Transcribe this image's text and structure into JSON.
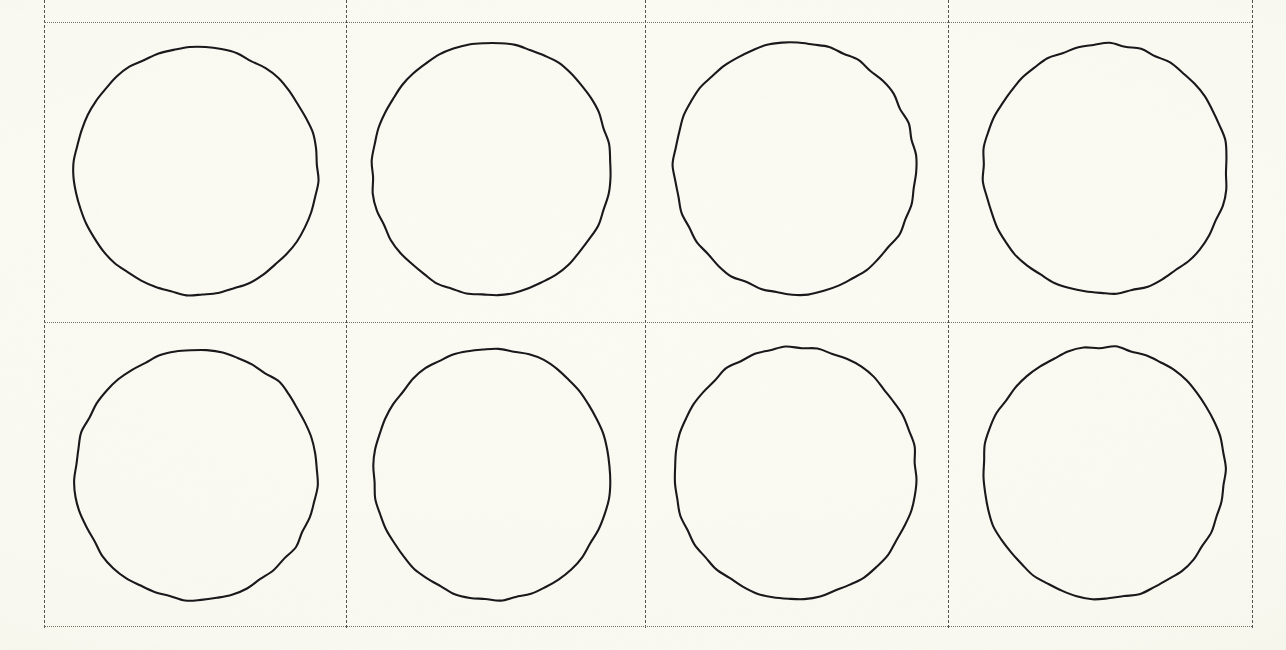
{
  "document": {
    "kind": "scanned-worksheet",
    "title": "Circle Grid Worksheet",
    "page_width": 1286,
    "page_height": 650,
    "background_color": "#fdfdfa",
    "has_text": false,
    "note": ""
  },
  "grid": {
    "columns": 4,
    "rows": 2,
    "line_style_vertical": "dashed",
    "line_style_horizontal": "dotted",
    "vertical_line_color": "#3b3b3b",
    "horizontal_line_color": "#6d6a5e",
    "vertical_positions": [
      44,
      346,
      645,
      948,
      1252
    ],
    "horizontal_positions": [
      22,
      322,
      626
    ],
    "vertical_extends_above_top": true
  },
  "shapes": {
    "type": "circle-outline",
    "count": 8,
    "stroke_color": "#17171a",
    "stroke_width": 2.1,
    "fill": "none",
    "items": [
      {
        "name": "circle-r1-c1",
        "row": 1,
        "col": 1,
        "cx": 196,
        "cy": 171,
        "rx": 122,
        "ry": 124,
        "rotate": -3
      },
      {
        "name": "circle-r1-c2",
        "row": 1,
        "col": 2,
        "cx": 491,
        "cy": 169,
        "rx": 119,
        "ry": 127,
        "rotate": 4
      },
      {
        "name": "circle-r1-c3",
        "row": 1,
        "col": 3,
        "cx": 795,
        "cy": 168,
        "rx": 121,
        "ry": 126,
        "rotate": -6
      },
      {
        "name": "circle-r1-c4",
        "row": 1,
        "col": 4,
        "cx": 1105,
        "cy": 169,
        "rx": 122,
        "ry": 125,
        "rotate": 2
      },
      {
        "name": "circle-r2-c1",
        "row": 2,
        "col": 1,
        "cx": 196,
        "cy": 475,
        "rx": 121,
        "ry": 125,
        "rotate": 5
      },
      {
        "name": "circle-r2-c2",
        "row": 2,
        "col": 2,
        "cx": 492,
        "cy": 474,
        "rx": 118,
        "ry": 126,
        "rotate": -4
      },
      {
        "name": "circle-r2-c3",
        "row": 2,
        "col": 3,
        "cx": 795,
        "cy": 473,
        "rx": 121,
        "ry": 126,
        "rotate": 3
      },
      {
        "name": "circle-r2-c4",
        "row": 2,
        "col": 4,
        "cx": 1104,
        "cy": 473,
        "rx": 121,
        "ry": 126,
        "rotate": -2
      }
    ]
  }
}
